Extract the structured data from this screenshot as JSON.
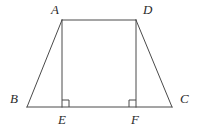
{
  "figure": {
    "kind": "geometry-diagram",
    "shape": "trapezoid",
    "width": 202,
    "height": 129,
    "background_color": "#ffffff",
    "stroke_color": "#4a4a4a",
    "stroke_width": 1,
    "label_color": "#2b2b2b",
    "label_style": "italic-serif",
    "labels": {
      "A": "A",
      "B": "B",
      "C": "C",
      "D": "D",
      "E": "E",
      "F": "F"
    },
    "points": {
      "A": {
        "x": 62,
        "y": 20
      },
      "B": {
        "x": 27,
        "y": 107
      },
      "C": {
        "x": 172,
        "y": 107
      },
      "D": {
        "x": 136,
        "y": 20
      },
      "E": {
        "x": 62,
        "y": 107
      },
      "F": {
        "x": 136,
        "y": 107
      }
    },
    "segments": [
      {
        "name": "AD",
        "from": "A",
        "to": "D",
        "role": "top-base"
      },
      {
        "name": "BC",
        "from": "B",
        "to": "C",
        "role": "bottom-base"
      },
      {
        "name": "AB",
        "from": "A",
        "to": "B",
        "role": "left-leg"
      },
      {
        "name": "DC",
        "from": "D",
        "to": "C",
        "role": "right-leg"
      },
      {
        "name": "AE",
        "from": "A",
        "to": "E",
        "role": "left-altitude"
      },
      {
        "name": "DF",
        "from": "D",
        "to": "F",
        "role": "right-altitude"
      }
    ],
    "right_angle_marks": [
      {
        "name": "right-angle-at-E",
        "vertex": "E",
        "size": 7,
        "opens": "right"
      },
      {
        "name": "right-angle-at-F",
        "vertex": "F",
        "size": 7,
        "opens": "left"
      }
    ]
  }
}
